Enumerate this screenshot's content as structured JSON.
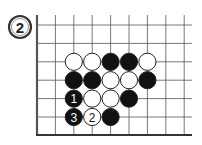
{
  "diagram": {
    "label": "2",
    "board": {
      "columns": 9,
      "rows": 7,
      "edges": [
        "left",
        "bottom"
      ]
    },
    "stones": [
      {
        "color": "white",
        "col": 2,
        "row": 2,
        "number": ""
      },
      {
        "color": "white",
        "col": 3,
        "row": 2,
        "number": ""
      },
      {
        "color": "black",
        "col": 4,
        "row": 2,
        "number": ""
      },
      {
        "color": "black",
        "col": 5,
        "row": 2,
        "number": ""
      },
      {
        "color": "white",
        "col": 6,
        "row": 2,
        "number": ""
      },
      {
        "color": "black",
        "col": 2,
        "row": 3,
        "number": ""
      },
      {
        "color": "black",
        "col": 3,
        "row": 3,
        "number": ""
      },
      {
        "color": "white",
        "col": 4,
        "row": 3,
        "number": ""
      },
      {
        "color": "white",
        "col": 5,
        "row": 3,
        "number": ""
      },
      {
        "color": "black",
        "col": 6,
        "row": 3,
        "number": ""
      },
      {
        "color": "black",
        "col": 2,
        "row": 4,
        "number": "1"
      },
      {
        "color": "white",
        "col": 3,
        "row": 4,
        "number": ""
      },
      {
        "color": "white",
        "col": 4,
        "row": 4,
        "number": ""
      },
      {
        "color": "black",
        "col": 5,
        "row": 4,
        "number": ""
      },
      {
        "color": "black",
        "col": 2,
        "row": 5,
        "number": "3"
      },
      {
        "color": "white",
        "col": 3,
        "row": 5,
        "number": "2"
      },
      {
        "color": "black",
        "col": 4,
        "row": 5,
        "number": ""
      }
    ]
  }
}
